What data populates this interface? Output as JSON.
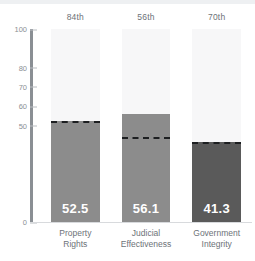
{
  "chart_data": {
    "type": "bar",
    "title": "",
    "subtitle": "",
    "xlabel": "",
    "ylabel": "",
    "ylim": [
      0,
      100
    ],
    "grid": false,
    "legend": null,
    "categories": [
      "Property\nRights",
      "Judicial\nEffectiveness",
      "Government\nIntegrity"
    ],
    "category_lines": [
      [
        "Property",
        "Rights"
      ],
      [
        "Judicial",
        "Effectiveness"
      ],
      [
        "Government",
        "Integrity"
      ]
    ],
    "values": [
      52.5,
      56.1,
      41.3
    ],
    "value_labels": [
      "52.5",
      "56.1",
      "41.3"
    ],
    "percentile_ranks": [
      "84th",
      "56th",
      "70th"
    ],
    "reference_markers": [
      52.5,
      44.0,
      41.3
    ],
    "bar_colors": [
      "#8c8c8c",
      "#8c8c8c",
      "#5a5a5a"
    ],
    "track_color": "#f7f7f8",
    "marker_color": "#1d1f21",
    "axis_color": "#8a8f94",
    "tick_values": [
      100,
      80,
      70,
      60,
      50,
      0
    ],
    "tick_labels": [
      "100",
      "80",
      "70",
      "60",
      "50",
      "0"
    ]
  },
  "axis": {
    "label_color": "#8a8f94"
  }
}
